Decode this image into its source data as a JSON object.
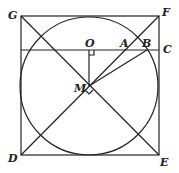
{
  "diagram": {
    "type": "geometry",
    "points": {
      "G": {
        "label": "G",
        "x": 21,
        "y": 16
      },
      "F": {
        "label": "F",
        "x": 159,
        "y": 16
      },
      "C": {
        "label": "C",
        "x": 159,
        "y": 50
      },
      "D": {
        "label": "D",
        "x": 21,
        "y": 155
      },
      "E": {
        "label": "E",
        "x": 159,
        "y": 155
      },
      "O": {
        "label": "O",
        "x": 89,
        "y": 50
      },
      "A": {
        "label": "A",
        "x": 125,
        "y": 50
      },
      "B": {
        "label": "B",
        "x": 147,
        "y": 50
      },
      "M": {
        "label": "M",
        "x": 89,
        "y": 86
      }
    },
    "circle": {
      "cx": 89,
      "cy": 86,
      "r": 69
    },
    "right_angles": [
      "O",
      "M"
    ]
  }
}
